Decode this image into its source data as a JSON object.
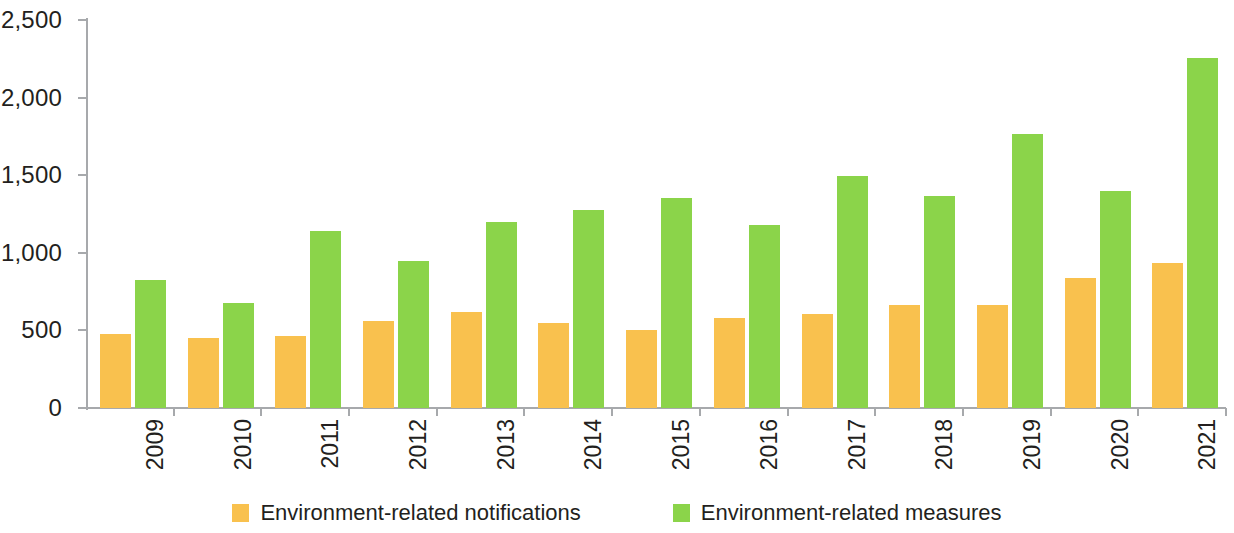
{
  "chart_data": {
    "type": "bar",
    "title": "",
    "xlabel": "",
    "ylabel": "",
    "grid": false,
    "legend_position": "bottom",
    "ylim": [
      0,
      2500
    ],
    "ytick_values": [
      0,
      500,
      1000,
      1500,
      2000,
      2500
    ],
    "ytick_labels": [
      "0",
      "500",
      "1,000",
      "1,500",
      "2,000",
      "2,500"
    ],
    "categories": [
      "2009",
      "2010",
      "2011",
      "2012",
      "2013",
      "2014",
      "2015",
      "2016",
      "2017",
      "2018",
      "2019",
      "2020",
      "2021"
    ],
    "series": [
      {
        "name": "Environment-related notifications",
        "color": "#f9c14e",
        "values": [
          480,
          450,
          463,
          558,
          620,
          548,
          503,
          580,
          608,
          663,
          665,
          835,
          935
        ]
      },
      {
        "name": "Environment-related measures",
        "color": "#8bd44a",
        "values": [
          825,
          675,
          1140,
          948,
          1200,
          1278,
          1350,
          1180,
          1495,
          1368,
          1765,
          1398,
          2255
        ]
      }
    ]
  },
  "legend": {
    "items": [
      {
        "label": "Environment-related notifications",
        "color": "#f9c14e"
      },
      {
        "label": "Environment-related measures",
        "color": "#8bd44a"
      }
    ]
  },
  "axes": {
    "y": {
      "ticks": [
        {
          "label": "2,500",
          "value": 2500
        },
        {
          "label": "2,000",
          "value": 2000
        },
        {
          "label": "1,500",
          "value": 1500
        },
        {
          "label": "1,000",
          "value": 1000
        },
        {
          "label": "500",
          "value": 500
        },
        {
          "label": "0",
          "value": 0
        }
      ]
    },
    "x": {
      "ticks": [
        "2009",
        "2010",
        "2011",
        "2012",
        "2013",
        "2014",
        "2015",
        "2016",
        "2017",
        "2018",
        "2019",
        "2020",
        "2021"
      ]
    }
  },
  "colors": {
    "notifications": "#f9c14e",
    "measures": "#8bd44a",
    "axis": "#a7a9ac",
    "text": "#231f20",
    "background": "#ffffff"
  }
}
